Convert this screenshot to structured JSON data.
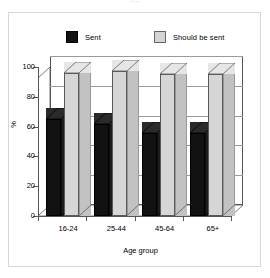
{
  "figure": {
    "clipped_title": "····",
    "background": "#ffffff",
    "border_color": "#d8d8d8"
  },
  "legend": {
    "position": "top",
    "entries": [
      {
        "label": "Sent",
        "color": "#121212",
        "swatch": "black-swatch"
      },
      {
        "label": "Should be sent",
        "color": "#d4d4d4",
        "swatch": "grey-swatch"
      }
    ]
  },
  "chart_data": {
    "type": "bar",
    "title": "",
    "xlabel": "Age group",
    "ylabel": "%",
    "ylim": [
      0,
      100
    ],
    "yticks": [
      0,
      20,
      40,
      60,
      80,
      100
    ],
    "ytick_labels": [
      "0",
      "20",
      "40",
      "60",
      "80",
      "100"
    ],
    "grid": true,
    "legend_position": "top",
    "style": "3d-clustered-bar",
    "categories": [
      "16-24",
      "25-44",
      "45-64",
      "65+"
    ],
    "series": [
      {
        "name": "Sent",
        "color": "#121212",
        "values": [
          65,
          62,
          56,
          56
        ]
      },
      {
        "name": "Should be sent",
        "color": "#d6d6d6",
        "values": [
          96,
          97,
          95,
          95
        ]
      }
    ]
  }
}
